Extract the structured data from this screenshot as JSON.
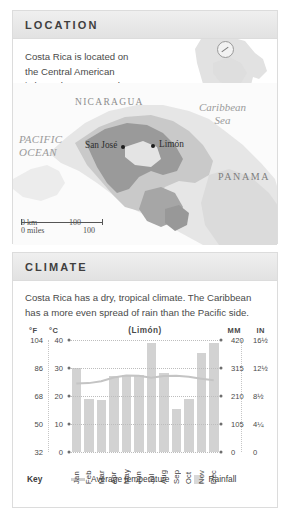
{
  "location": {
    "title": "LOCATION",
    "blurb": "Costa Rica is located on the Central American isthmus between North and South America.",
    "compass_icon": "compass-icon",
    "map": {
      "labels": {
        "nicaragua": "NICARAGUA",
        "panama": "PANAMA",
        "caribbean_line1": "Caribbean",
        "caribbean_line2": "Sea",
        "pacific_line1": "PACIFIC",
        "pacific_line2": "OCEAN"
      },
      "cities": [
        {
          "name": "San José"
        },
        {
          "name": "Limón"
        }
      ],
      "scale": {
        "km_zero": "0 km",
        "km_max": "100",
        "miles_zero": "0 miles",
        "miles_max": "100"
      }
    }
  },
  "climate": {
    "title": "CLIMATE",
    "blurb": "Costa Rica has a dry, tropical climate. The Caribbean has a more even spread of rain than the Pacific side.",
    "units": {
      "f": "°F",
      "c": "°C",
      "mm": "MM",
      "in": "IN"
    },
    "legend": {
      "key_label": "Key",
      "temperature_label": "Average temperature",
      "rainfall_label": "Rainfall"
    }
  },
  "chart_data": {
    "type": "bar",
    "title": "(Limón)",
    "xlabel": "",
    "ylabel": "",
    "grid": true,
    "legend_position": "bottom",
    "categories": [
      "Jan",
      "Feb",
      "Mar",
      "Apr",
      "May",
      "Jun",
      "Jul",
      "Aug",
      "Sep",
      "Oct",
      "Nov",
      "Dec"
    ],
    "axes": {
      "left_primary": {
        "unit": "°C",
        "ticks": [
          "40",
          "30",
          "20",
          "10",
          "0"
        ],
        "values": [
          40,
          30,
          20,
          10,
          0
        ],
        "range": [
          0,
          40
        ]
      },
      "left_secondary": {
        "unit": "°F",
        "ticks": [
          "104",
          "86",
          "68",
          "50",
          "32"
        ],
        "values": [
          104,
          86,
          68,
          50,
          32
        ],
        "range": [
          32,
          104
        ]
      },
      "right_primary": {
        "unit": "MM",
        "ticks": [
          "420",
          "315",
          "210",
          "105",
          "0"
        ],
        "values": [
          420,
          315,
          210,
          105,
          0
        ],
        "range": [
          0,
          420
        ]
      },
      "right_secondary": {
        "unit": "IN",
        "ticks": [
          "16½",
          "12½",
          "8½",
          "4¼",
          "0"
        ],
        "values": [
          16.5,
          12.5,
          8.5,
          4.25,
          0
        ],
        "range": [
          0,
          16.5
        ]
      }
    },
    "series": [
      {
        "name": "Rainfall",
        "type": "bar",
        "unit": "mm",
        "axis": "right",
        "values": [
          315,
          200,
          195,
          285,
          290,
          290,
          410,
          295,
          163,
          200,
          373,
          410
        ]
      },
      {
        "name": "Average temperature",
        "type": "line",
        "unit": "°C",
        "axis": "left",
        "values": [
          24.5,
          24.6,
          25.3,
          26.6,
          27.3,
          27.2,
          26.5,
          27.1,
          27.2,
          26.9,
          26.2,
          25.6
        ]
      }
    ]
  }
}
